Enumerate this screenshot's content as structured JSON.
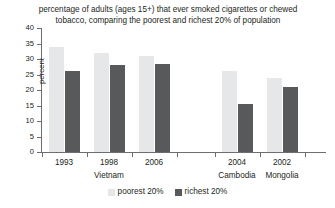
{
  "chart_data": {
    "type": "bar",
    "title": "percentage of adults (ages 15+) that ever smoked cigarettes or chewed tobacco, comparing the poorest and richest 20% of population",
    "title_lines": [
      "percentage of adults (ages 15+) that ever smoked cigarettes or chewed",
      "tobacco, comparing the poorest and richest 20% of population"
    ],
    "xlabel": "",
    "ylabel": "percent",
    "ylim": [
      0,
      40
    ],
    "ytick_step": 5,
    "yticks": [
      "40",
      "35",
      "30",
      "25",
      "20",
      "15",
      "10",
      "5",
      "0"
    ],
    "grid": false,
    "legend_position": "bottom-center",
    "categories": [
      "1993",
      "1998",
      "2006",
      "2004",
      "2002"
    ],
    "groups": [
      {
        "name": "Vietnam",
        "categories": [
          "1993",
          "1998",
          "2006"
        ]
      },
      {
        "name": "Cambodia",
        "categories": [
          "2004"
        ]
      },
      {
        "name": "Mongolia",
        "categories": [
          "2002"
        ]
      }
    ],
    "series": [
      {
        "name": "poorest 20%",
        "color": "#e6e7e8",
        "values": [
          34,
          32,
          31,
          26,
          24
        ]
      },
      {
        "name": "richest 20%",
        "color": "#58595b",
        "values": [
          26,
          28,
          28.5,
          15.5,
          21
        ]
      }
    ]
  },
  "legend": {
    "items": [
      {
        "label": "poorest 20%",
        "color": "#e6e7e8"
      },
      {
        "label": "richest 20%",
        "color": "#58595b"
      }
    ]
  },
  "colors": {
    "poorest": "#e6e7e8",
    "richest": "#58595b",
    "axis": "#6d6e71",
    "text": "#231f20",
    "background": "#ffffff"
  }
}
